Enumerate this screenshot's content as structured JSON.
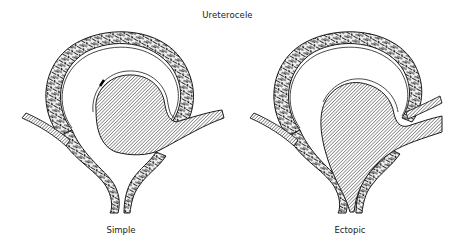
{
  "figure": {
    "title": "Ureterocele",
    "panels": [
      {
        "id": "simple",
        "label": "Simple"
      },
      {
        "id": "ectopic",
        "label": "Ectopic"
      }
    ]
  },
  "colors": {
    "line": "#1a1a1a",
    "background": "#ffffff",
    "hatch": "#333333"
  }
}
